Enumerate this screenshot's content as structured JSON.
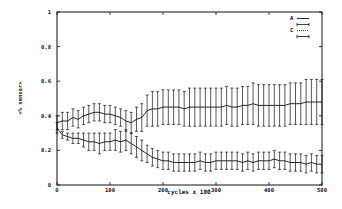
{
  "chart_data": {
    "type": "line",
    "title": "",
    "xlabel": "cycles x 100",
    "ylabel": "<% sensor>",
    "xlim": [
      0,
      500
    ],
    "ylim": [
      0,
      1
    ],
    "xticks": [
      0,
      100,
      200,
      300,
      400,
      500
    ],
    "yticks": [
      0,
      0.2,
      0.4,
      0.6,
      0.8,
      1
    ],
    "ytick_labels": [
      "0",
      "0.2",
      "0.4",
      "0.6",
      "0.8",
      "1"
    ],
    "xtick_labels": [
      "0",
      "100",
      "200",
      "300",
      "400",
      "500"
    ],
    "grid": false,
    "legend_position": "top-right",
    "legend": [
      {
        "label": "A",
        "style": "solid"
      },
      {
        "label": "",
        "style": "errorbar"
      },
      {
        "label": "C",
        "style": "dotted"
      },
      {
        "label": "",
        "style": "errorbar"
      }
    ],
    "x": [
      0,
      10,
      20,
      30,
      40,
      50,
      60,
      70,
      80,
      90,
      100,
      110,
      120,
      130,
      140,
      150,
      160,
      170,
      180,
      190,
      200,
      210,
      220,
      230,
      240,
      250,
      260,
      270,
      280,
      290,
      300,
      310,
      320,
      330,
      340,
      350,
      360,
      370,
      380,
      390,
      400,
      410,
      420,
      430,
      440,
      450,
      460,
      470,
      480,
      490,
      500
    ],
    "series": [
      {
        "name": "A",
        "values": [
          0.36,
          0.37,
          0.37,
          0.39,
          0.38,
          0.4,
          0.41,
          0.42,
          0.42,
          0.41,
          0.41,
          0.4,
          0.39,
          0.37,
          0.36,
          0.38,
          0.39,
          0.43,
          0.44,
          0.44,
          0.45,
          0.45,
          0.45,
          0.45,
          0.44,
          0.45,
          0.45,
          0.45,
          0.45,
          0.45,
          0.45,
          0.45,
          0.46,
          0.45,
          0.45,
          0.46,
          0.46,
          0.47,
          0.46,
          0.46,
          0.46,
          0.46,
          0.46,
          0.46,
          0.47,
          0.47,
          0.47,
          0.48,
          0.48,
          0.48,
          0.48
        ],
        "errors": [
          0.04,
          0.05,
          0.05,
          0.05,
          0.05,
          0.05,
          0.05,
          0.05,
          0.05,
          0.05,
          0.05,
          0.05,
          0.05,
          0.06,
          0.06,
          0.07,
          0.08,
          0.09,
          0.1,
          0.1,
          0.1,
          0.1,
          0.1,
          0.1,
          0.1,
          0.11,
          0.11,
          0.11,
          0.11,
          0.11,
          0.11,
          0.11,
          0.11,
          0.11,
          0.11,
          0.11,
          0.11,
          0.12,
          0.12,
          0.12,
          0.12,
          0.12,
          0.12,
          0.12,
          0.12,
          0.12,
          0.12,
          0.13,
          0.13,
          0.13,
          0.13
        ]
      },
      {
        "name": "C",
        "values": [
          0.33,
          0.29,
          0.28,
          0.27,
          0.27,
          0.26,
          0.25,
          0.25,
          0.24,
          0.25,
          0.25,
          0.26,
          0.25,
          0.26,
          0.24,
          0.22,
          0.2,
          0.18,
          0.16,
          0.15,
          0.14,
          0.14,
          0.13,
          0.13,
          0.13,
          0.13,
          0.13,
          0.14,
          0.13,
          0.13,
          0.14,
          0.14,
          0.14,
          0.14,
          0.14,
          0.13,
          0.14,
          0.13,
          0.14,
          0.14,
          0.14,
          0.15,
          0.14,
          0.14,
          0.13,
          0.13,
          0.13,
          0.12,
          0.13,
          0.12,
          0.12
        ]
      }
    ],
    "series_c_errors": [
      0.03,
      0.02,
      0.02,
      0.03,
      0.03,
      0.04,
      0.05,
      0.05,
      0.06,
      0.05,
      0.05,
      0.06,
      0.06,
      0.06,
      0.06,
      0.06,
      0.06,
      0.05,
      0.05,
      0.05,
      0.05,
      0.05,
      0.05,
      0.05,
      0.05,
      0.05,
      0.05,
      0.05,
      0.05,
      0.05,
      0.05,
      0.05,
      0.05,
      0.05,
      0.05,
      0.05,
      0.05,
      0.05,
      0.05,
      0.05,
      0.05,
      0.05,
      0.05,
      0.05,
      0.05,
      0.05,
      0.05,
      0.05,
      0.05,
      0.05,
      0.05
    ]
  }
}
